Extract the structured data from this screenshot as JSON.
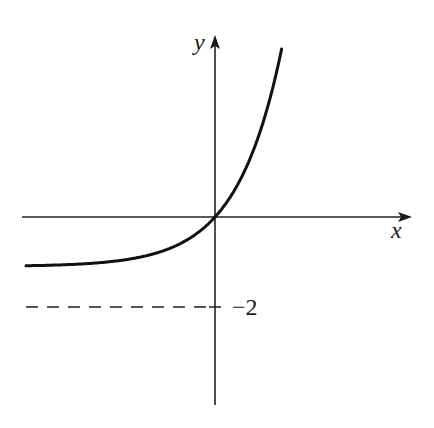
{
  "chart_data": {
    "type": "line",
    "title": "",
    "xlabel": "x",
    "ylabel": "y",
    "series": [
      {
        "name": "curve",
        "description": "Increasing exponential-type curve passing through the origin, approaching horizontal asymptote y = -2 as x -> -infinity and growing steeply for x > 0",
        "x": [
          -4.2,
          -3.0,
          -2.0,
          -1.0,
          -0.5,
          0,
          0.5,
          1.0,
          1.3,
          1.5
        ],
        "y": [
          -1.97,
          -1.9,
          -1.73,
          -1.26,
          -0.79,
          0,
          1.3,
          3.44,
          5.34,
          6.96
        ]
      }
    ],
    "asymptote": {
      "y": -2,
      "style": "dashed",
      "label": "−2"
    },
    "annotations": [
      "−2"
    ],
    "axes": {
      "x_arrow": true,
      "y_arrow": true,
      "ticks": false
    },
    "grid": false,
    "legend": null,
    "colors": {
      "line": "#111111",
      "axis": "#222222",
      "background": "#ffffff"
    }
  },
  "labels": {
    "x_axis": "x",
    "y_axis": "y",
    "asymptote": "−2"
  }
}
